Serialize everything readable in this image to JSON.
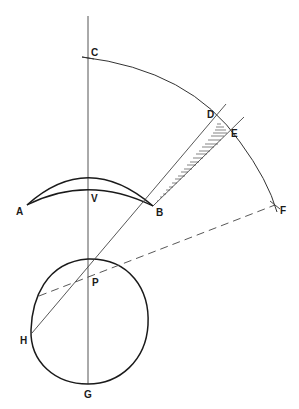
{
  "diagram": {
    "type": "geometric-optics-construction",
    "labels": {
      "C": "C",
      "D": "D",
      "E": "E",
      "F": "F",
      "A": "A",
      "V": "V",
      "B": "B",
      "P": "P",
      "H": "H",
      "G": "G"
    },
    "colors": {
      "ink": "#1a1a1a",
      "thin_line": "#555555",
      "background": "#ffffff"
    }
  }
}
